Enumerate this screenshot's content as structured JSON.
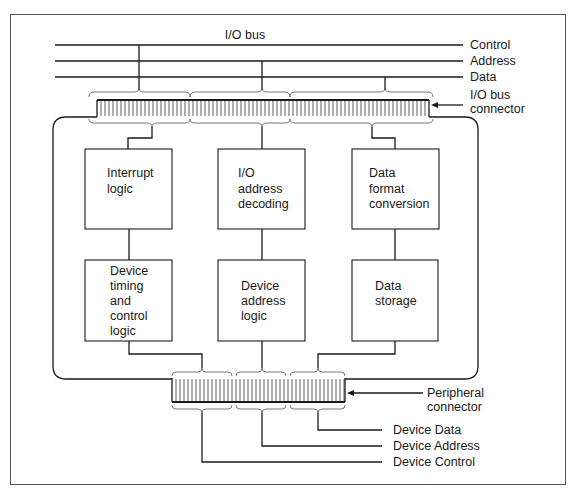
{
  "bus": {
    "title": "I/O bus",
    "lines": [
      {
        "label": "Control",
        "y": 45
      },
      {
        "label": "Address",
        "y": 61
      },
      {
        "label": "Data",
        "y": 77
      }
    ]
  },
  "io_bus_connector": {
    "label_line1": "I/O bus",
    "label_line2": "connector"
  },
  "peripheral_connector": {
    "label_line1": "Peripheral",
    "label_line2": "connector"
  },
  "blocks": {
    "interrupt_logic": [
      "Interrupt",
      "logic"
    ],
    "io_address_decoding": [
      "I/O",
      "address",
      "decoding"
    ],
    "data_format_conversion": [
      "Data",
      "format",
      "conversion"
    ],
    "device_timing_control": [
      "Device",
      "timing",
      "and",
      "control",
      "logic"
    ],
    "device_address_logic": [
      "Device",
      "address",
      "logic"
    ],
    "data_storage": [
      "Data",
      "storage"
    ]
  },
  "device_lines": {
    "data": "Device Data",
    "address": "Device Address",
    "control": "Device Control"
  }
}
